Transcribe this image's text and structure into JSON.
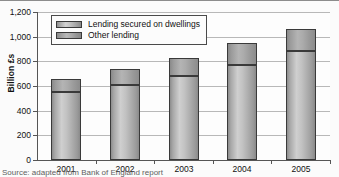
{
  "figure": {
    "source_note": "Source: adapted from Bank of England report"
  },
  "chart_data": {
    "type": "bar",
    "stacked": true,
    "title": "",
    "xlabel": "",
    "ylabel": "Billion £s",
    "categories": [
      "2001",
      "2002",
      "2003",
      "2004",
      "2005"
    ],
    "series": [
      {
        "name": "Lending secured on dwellings",
        "values": [
          550,
          605,
          680,
          770,
          880
        ]
      },
      {
        "name": "Other lending",
        "values": [
          110,
          135,
          150,
          180,
          185
        ]
      }
    ],
    "totals": [
      660,
      740,
      830,
      950,
      1065
    ],
    "ylim": [
      0,
      1200
    ],
    "yticks": [
      0,
      200,
      400,
      600,
      800,
      1000,
      1200
    ],
    "ytick_labels": [
      "0",
      "200",
      "400",
      "600",
      "800",
      "1,000",
      "1,200"
    ],
    "grid": "horizontal",
    "legend_position": "upper-left-inside",
    "legend": [
      "Lending secured on dwellings",
      "Other lending"
    ],
    "colors": {
      "secured_on_dwellings": "#c2c2c2",
      "other_lending": "#a8a8a8",
      "bar_outline": "#3a3a3a",
      "gridline": "#b8b8b8",
      "axis": "#555555",
      "background": "#fdfdfd"
    }
  }
}
